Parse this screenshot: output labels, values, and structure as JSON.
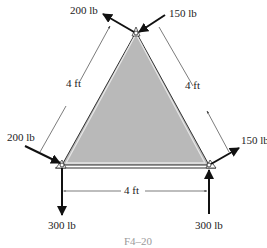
{
  "figure": {
    "caption": "F4–20",
    "fill_color": "#b8b8b8",
    "edge_color": "#333333"
  },
  "forces": {
    "top_left": "200 lb",
    "top_right": "150 lb",
    "left_side": "200 lb",
    "right_side": "150 lb",
    "bottom_left": "300 lb",
    "bottom_right": "300 lb"
  },
  "dimensions": {
    "left_side": "4 ft",
    "right_side": "4 ft",
    "base": "4 ft"
  }
}
